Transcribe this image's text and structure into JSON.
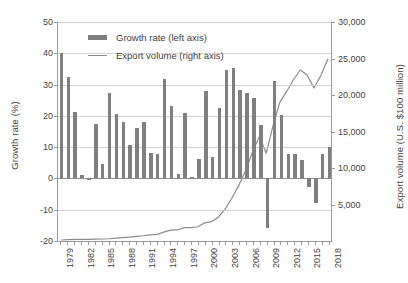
{
  "chart_data": {
    "type": "bar",
    "title": "",
    "xlabel": "",
    "ylabel": "Growth rate (%)",
    "y2label": "Export volume (U.S. $100 million)",
    "grid": true,
    "legend_position": "top-center",
    "ylim": [
      -20,
      50
    ],
    "yticks": [
      -20,
      -10,
      0,
      10,
      20,
      30,
      40,
      50
    ],
    "y2lim": [
      0,
      30000
    ],
    "y2ticks": [
      5000,
      10000,
      15000,
      20000,
      25000,
      30000
    ],
    "y2ticklabels": [
      "5,000",
      "10,000",
      "15,000",
      "20,000",
      "25,000",
      "30,000"
    ],
    "xticklabels": [
      "1979",
      "1982",
      "1985",
      "1988",
      "1991",
      "1994",
      "1997",
      "2000",
      "2003",
      "2006",
      "2009",
      "2012",
      "2015",
      "2018"
    ],
    "xtick_interval": 3,
    "categories": [
      1979,
      1980,
      1981,
      1982,
      1983,
      1984,
      1985,
      1986,
      1987,
      1988,
      1989,
      1990,
      1991,
      1992,
      1993,
      1994,
      1995,
      1996,
      1997,
      1998,
      1999,
      2000,
      2001,
      2002,
      2003,
      2004,
      2005,
      2006,
      2007,
      2008,
      2009,
      2010,
      2011,
      2012,
      2013,
      2014,
      2015,
      2016,
      2017,
      2018
    ],
    "series": [
      {
        "name": "Growth rate (left axis)",
        "axis": "left",
        "type": "bar",
        "color": "#7f7f7f",
        "values": [
          40.0,
          32.5,
          21.3,
          1.1,
          -0.4,
          17.5,
          4.7,
          27.3,
          20.5,
          17.9,
          10.8,
          16.1,
          17.9,
          8.0,
          7.9,
          31.9,
          23.0,
          1.5,
          21.0,
          0.5,
          6.1,
          27.8,
          6.8,
          22.4,
          34.6,
          35.4,
          28.4,
          27.2,
          25.7,
          17.2,
          -16.0,
          31.3,
          20.3,
          7.9,
          7.9,
          6.0,
          -2.8,
          -7.7,
          7.9,
          9.9
        ]
      },
      {
        "name": "Export volume (right axis)",
        "axis": "right",
        "type": "line",
        "color": "#8b8b8b",
        "values": [
          136,
          181,
          220,
          223,
          222,
          261,
          274,
          309,
          394,
          475,
          525,
          621,
          719,
          849,
          917,
          1210,
          1488,
          1511,
          1828,
          1837,
          1949,
          2492,
          2661,
          3256,
          4382,
          5933,
          7620,
          9690,
          12180,
          14307,
          12016,
          15778,
          18984,
          20487,
          22090,
          23423,
          22735,
          20976,
          22635,
          24874
        ]
      }
    ]
  }
}
